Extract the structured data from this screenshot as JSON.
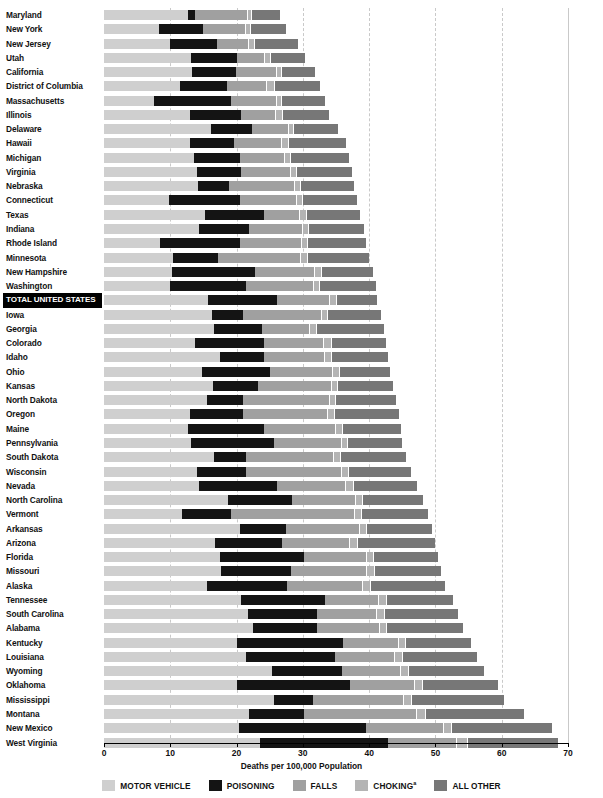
{
  "chart_data": {
    "type": "bar",
    "orientation": "horizontal",
    "stacked": true,
    "title": "",
    "xlabel": "Deaths per 100,000 Population",
    "ylabel": "",
    "xlim": [
      0,
      70
    ],
    "xticks": [
      0,
      10,
      20,
      30,
      40,
      50,
      60,
      70
    ],
    "grid": "vertical dashed gridlines at each 10 unit tick",
    "legend_position": "bottom-center",
    "series": [
      {
        "name": "MOTOR VEHICLE",
        "color": "#cfcfcf"
      },
      {
        "name": "POISONING",
        "color": "#141414"
      },
      {
        "name": "FALLS",
        "color": "#a0a0a0"
      },
      {
        "name": "CHOKING",
        "color": "#b4b4b4"
      },
      {
        "name": "ALL OTHER",
        "color": "#777777"
      }
    ],
    "categories": [
      "Maryland",
      "New York",
      "New Jersey",
      "Utah",
      "California",
      "District of Columbia",
      "Massachusetts",
      "Illinois",
      "Delaware",
      "Hawaii",
      "Michigan",
      "Virginia",
      "Nebraska",
      "Connecticut",
      "Texas",
      "Indiana",
      "Rhode Island",
      "Minnesota",
      "New Hampshire",
      "Washington",
      "TOTAL UNITED STATES",
      "Iowa",
      "Georgia",
      "Colorado",
      "Idaho",
      "Ohio",
      "Kansas",
      "North Dakota",
      "Oregon",
      "Maine",
      "Pennsylvania",
      "South Dakota",
      "Wisconsin",
      "Nevada",
      "North Carolina",
      "Vermont",
      "Arkansas",
      "Arizona",
      "Florida",
      "Missouri",
      "Alaska",
      "Tennessee",
      "South Carolina",
      "Alabama",
      "Kentucky",
      "Louisiana",
      "Wyoming",
      "Oklahoma",
      "Mississippi",
      "Montana",
      "New Mexico",
      "West Virginia"
    ],
    "rows": [
      {
        "state": "Maryland",
        "total": 26.6,
        "values": [
          12.7,
          1.1,
          7.8,
          0.6,
          4.4
        ],
        "highlight": false
      },
      {
        "state": "New York",
        "total": 27.4,
        "values": [
          8.3,
          6.7,
          6.3,
          0.7,
          5.4
        ],
        "highlight": false
      },
      {
        "state": "New Jersey",
        "total": 29.3,
        "values": [
          9.9,
          7.2,
          4.6,
          0.9,
          6.7
        ],
        "highlight": false
      },
      {
        "state": "Utah",
        "total": 30.4,
        "values": [
          13.2,
          6.9,
          4.1,
          0.8,
          5.4
        ],
        "highlight": false
      },
      {
        "state": "California",
        "total": 31.8,
        "values": [
          13.3,
          6.6,
          6.0,
          0.8,
          5.1
        ],
        "highlight": false
      },
      {
        "state": "District of Columbia",
        "total": 32.6,
        "values": [
          11.5,
          7.0,
          6.0,
          1.1,
          7.0
        ],
        "highlight": false
      },
      {
        "state": "Massachusetts",
        "total": 33.4,
        "values": [
          7.6,
          11.5,
          6.8,
          0.8,
          6.7
        ],
        "highlight": false
      },
      {
        "state": "Illinois",
        "total": 33.9,
        "values": [
          13.0,
          7.6,
          5.2,
          1.0,
          7.1
        ],
        "highlight": false
      },
      {
        "state": "Delaware",
        "total": 35.3,
        "values": [
          16.2,
          6.1,
          5.4,
          0.8,
          6.8
        ],
        "highlight": false
      },
      {
        "state": "Hawaii",
        "total": 36.5,
        "values": [
          12.9,
          6.7,
          7.1,
          1.0,
          8.8
        ],
        "highlight": false
      },
      {
        "state": "Michigan",
        "total": 37.0,
        "values": [
          13.6,
          6.9,
          6.6,
          1.0,
          8.9
        ],
        "highlight": false
      },
      {
        "state": "Virginia",
        "total": 37.4,
        "values": [
          14.0,
          6.6,
          7.4,
          0.9,
          8.5
        ],
        "highlight": false
      },
      {
        "state": "Nebraska",
        "total": 37.7,
        "values": [
          14.2,
          4.7,
          9.7,
          1.0,
          8.1
        ],
        "highlight": false
      },
      {
        "state": "Connecticut",
        "total": 38.2,
        "values": [
          9.8,
          10.7,
          8.4,
          0.9,
          8.4
        ],
        "highlight": false
      },
      {
        "state": "Texas",
        "total": 38.6,
        "values": [
          15.3,
          8.9,
          5.2,
          1.1,
          8.1
        ],
        "highlight": false
      },
      {
        "state": "Indiana",
        "total": 39.2,
        "values": [
          14.4,
          7.5,
          7.9,
          1.0,
          8.4
        ],
        "highlight": false
      },
      {
        "state": "Rhode Island",
        "total": 39.6,
        "values": [
          8.5,
          12.0,
          9.2,
          1.0,
          8.9
        ],
        "highlight": false
      },
      {
        "state": "Minnesota",
        "total": 40.0,
        "values": [
          10.4,
          6.8,
          12.4,
          1.0,
          9.4
        ],
        "highlight": false
      },
      {
        "state": "New Hampshire",
        "total": 40.6,
        "values": [
          10.2,
          12.6,
          8.9,
          1.0,
          7.9
        ],
        "highlight": false
      },
      {
        "state": "Washington",
        "total": 41.0,
        "values": [
          10.0,
          11.4,
          10.1,
          1.0,
          8.5
        ],
        "highlight": false
      },
      {
        "state": "TOTAL UNITED STATES",
        "total": 41.2,
        "values": [
          15.7,
          10.4,
          7.9,
          1.0,
          6.2
        ],
        "highlight": true
      },
      {
        "state": "Iowa",
        "total": 41.8,
        "values": [
          16.3,
          4.7,
          11.7,
          1.0,
          8.1
        ],
        "highlight": false
      },
      {
        "state": "Georgia",
        "total": 42.2,
        "values": [
          16.6,
          7.3,
          7.1,
          1.0,
          10.2
        ],
        "highlight": false
      },
      {
        "state": "Colorado",
        "total": 42.6,
        "values": [
          13.8,
          10.3,
          9.0,
          1.1,
          8.4
        ],
        "highlight": false
      },
      {
        "state": "Idaho",
        "total": 42.9,
        "values": [
          17.5,
          6.7,
          9.0,
          1.0,
          8.7
        ],
        "highlight": false
      },
      {
        "state": "Ohio",
        "total": 43.2,
        "values": [
          14.8,
          10.2,
          9.4,
          1.0,
          7.8
        ],
        "highlight": false
      },
      {
        "state": "Kansas",
        "total": 43.6,
        "values": [
          16.5,
          6.8,
          10.9,
          1.0,
          8.4
        ],
        "highlight": false
      },
      {
        "state": "North Dakota",
        "total": 44.0,
        "values": [
          15.5,
          5.4,
          13.0,
          1.0,
          9.1
        ],
        "highlight": false
      },
      {
        "state": "Oregon",
        "total": 44.5,
        "values": [
          13.0,
          8.0,
          12.7,
          1.0,
          9.8
        ],
        "highlight": false
      },
      {
        "state": "Maine",
        "total": 44.8,
        "values": [
          12.7,
          11.4,
          10.8,
          1.0,
          8.9
        ],
        "highlight": false
      },
      {
        "state": "Pennsylvania",
        "total": 45.0,
        "values": [
          13.2,
          12.5,
          10.0,
          1.0,
          8.3
        ],
        "highlight": false
      },
      {
        "state": "South Dakota",
        "total": 45.6,
        "values": [
          16.6,
          4.8,
          13.2,
          1.0,
          10.0
        ],
        "highlight": false
      },
      {
        "state": "Wisconsin",
        "total": 46.3,
        "values": [
          14.1,
          7.3,
          14.4,
          1.0,
          9.5
        ],
        "highlight": false
      },
      {
        "state": "Nevada",
        "total": 47.3,
        "values": [
          14.4,
          11.7,
          10.3,
          1.1,
          9.8
        ],
        "highlight": false
      },
      {
        "state": "North Carolina",
        "total": 48.2,
        "values": [
          18.7,
          9.6,
          9.6,
          1.1,
          9.2
        ],
        "highlight": false
      },
      {
        "state": "Vermont",
        "total": 48.9,
        "values": [
          11.8,
          7.4,
          18.5,
          1.1,
          10.1
        ],
        "highlight": false
      },
      {
        "state": "Arkansas",
        "total": 49.5,
        "values": [
          20.5,
          7.0,
          11.0,
          1.0,
          10.0
        ],
        "highlight": false
      },
      {
        "state": "Arizona",
        "total": 50.0,
        "values": [
          16.7,
          10.2,
          10.1,
          1.1,
          11.9
        ],
        "highlight": false
      },
      {
        "state": "Florida",
        "total": 50.4,
        "values": [
          17.5,
          12.7,
          9.3,
          1.1,
          9.8
        ],
        "highlight": false
      },
      {
        "state": "Missouri",
        "total": 50.8,
        "values": [
          17.7,
          10.5,
          11.4,
          1.1,
          10.1
        ],
        "highlight": false
      },
      {
        "state": "Alaska",
        "total": 51.4,
        "values": [
          15.6,
          12.0,
          11.4,
          1.1,
          11.3
        ],
        "highlight": false
      },
      {
        "state": "Tennessee",
        "total": 52.6,
        "values": [
          20.6,
          12.8,
          8.0,
          1.1,
          10.1
        ],
        "highlight": false
      },
      {
        "state": "South Carolina",
        "total": 53.4,
        "values": [
          21.7,
          10.4,
          9.0,
          1.1,
          11.2
        ],
        "highlight": false
      },
      {
        "state": "Alabama",
        "total": 54.1,
        "values": [
          22.5,
          9.6,
          9.4,
          1.1,
          11.5
        ],
        "highlight": false
      },
      {
        "state": "Kentucky",
        "total": 55.4,
        "values": [
          20.0,
          16.1,
          8.2,
          1.1,
          10.0
        ],
        "highlight": false
      },
      {
        "state": "Louisiana",
        "total": 56.2,
        "values": [
          21.4,
          13.4,
          9.0,
          1.2,
          11.2
        ],
        "highlight": false
      },
      {
        "state": "Wyoming",
        "total": 57.3,
        "values": [
          25.3,
          10.6,
          8.8,
          1.2,
          11.4
        ],
        "highlight": false
      },
      {
        "state": "Oklahoma",
        "total": 59.4,
        "values": [
          20.1,
          17.0,
          9.7,
          1.2,
          11.4
        ],
        "highlight": false
      },
      {
        "state": "Mississippi",
        "total": 60.3,
        "values": [
          25.6,
          6.0,
          13.5,
          1.2,
          14.0
        ],
        "highlight": false
      },
      {
        "state": "Montana",
        "total": 63.4,
        "values": [
          21.8,
          8.3,
          17.0,
          1.3,
          15.0
        ],
        "highlight": false
      },
      {
        "state": "New Mexico",
        "total": 67.6,
        "values": [
          20.3,
          19.3,
          11.6,
          1.2,
          15.2
        ],
        "highlight": false
      },
      {
        "state": "West Virginia",
        "total": 68.5,
        "values": [
          23.5,
          19.4,
          10.2,
          1.7,
          13.7
        ],
        "highlight": false
      }
    ]
  },
  "axis": {
    "title": "Deaths per 100,000 Population",
    "tick_labels": [
      "0",
      "10",
      "20",
      "30",
      "40",
      "50",
      "60",
      "70"
    ]
  },
  "legend": {
    "items": [
      {
        "label": "MOTOR VEHICLE",
        "sup": "",
        "color": "#cfcfcf",
        "key": "mv"
      },
      {
        "label": "POISONING",
        "sup": "",
        "color": "#141414",
        "key": "po"
      },
      {
        "label": "FALLS",
        "sup": "",
        "color": "#a0a0a0",
        "key": "fa"
      },
      {
        "label": "CHOKING",
        "sup": "a",
        "color": "#b4b4b4",
        "key": "ch"
      },
      {
        "label": "ALL OTHER",
        "sup": "",
        "color": "#777777",
        "key": "ao"
      }
    ]
  }
}
